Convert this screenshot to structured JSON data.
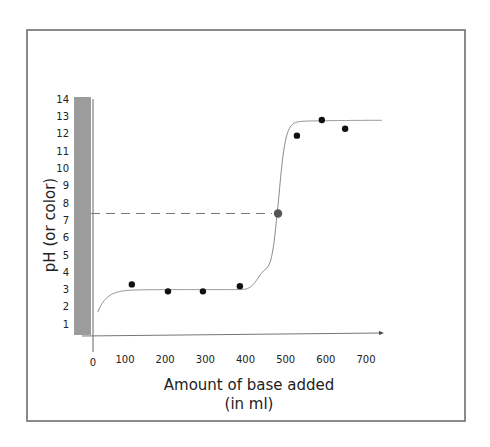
{
  "chart_data": {
    "type": "scatter",
    "title": "",
    "xlabel": "Amount of base added",
    "xlabel_line2": "(in ml)",
    "ylabel": "pH (or color)",
    "x_ticks": [
      "0",
      "100",
      "200",
      "300",
      "400",
      "500",
      "600",
      "700"
    ],
    "y_ticks": [
      "14",
      "13",
      "12",
      "11",
      "10",
      "9",
      "8",
      "7",
      "6",
      "5",
      "4",
      "3",
      "2",
      "1"
    ],
    "xlim": [
      0,
      700
    ],
    "ylim": [
      0,
      14
    ],
    "grid": false,
    "legend": null,
    "series": [
      {
        "name": "measured points",
        "marker": "circle",
        "color": "#111111",
        "points": [
          {
            "x": 117,
            "y": 3.3
          },
          {
            "x": 207,
            "y": 2.9
          },
          {
            "x": 294,
            "y": 2.9
          },
          {
            "x": 386,
            "y": 3.2
          },
          {
            "x": 528,
            "y": 11.9
          },
          {
            "x": 590,
            "y": 12.8
          },
          {
            "x": 648,
            "y": 12.3
          }
        ]
      },
      {
        "name": "equivalence point",
        "marker": "circle",
        "color": "#555555",
        "points": [
          {
            "x": 481,
            "y": 7.4
          }
        ]
      },
      {
        "name": "titration curve (fit)",
        "type": "line",
        "color": "#888888",
        "shape": "sigmoid",
        "start": {
          "x": 15,
          "y": 1.7
        },
        "lower_plateau_pH": 3.0,
        "inflection": {
          "x": 481,
          "y": 7.4
        },
        "upper_plateau_pH": 12.7,
        "end": {
          "x": 740,
          "y": 12.8
        }
      }
    ],
    "annotations": [
      {
        "type": "dashed_horizontal_line",
        "from_x": 0,
        "to_x": 481,
        "y": 7.4,
        "color": "#777777"
      },
      {
        "type": "color_scale_bar",
        "description": "gray vertical bar alongside pH axis",
        "color": "#9a9a9a",
        "y_range": [
          0,
          14
        ]
      }
    ]
  },
  "colors": {
    "frame": "#6e6e6e",
    "axis": "#666666",
    "bar": "#9c9c9c",
    "curve": "#8a8a8a",
    "point": "#111111",
    "equivalence_point": "#585858",
    "dash": "#777777"
  }
}
